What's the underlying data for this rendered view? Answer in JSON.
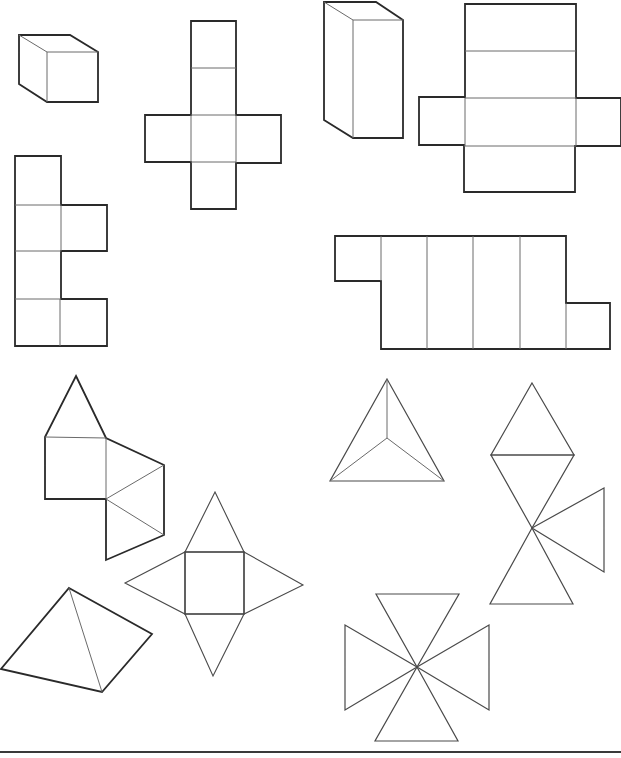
{
  "page": {
    "title": "Solids and their nets worksheet",
    "line_color": "#2a2a2a",
    "inner_line_color": "#6a6a6a",
    "background": "#ffffff"
  },
  "figures": [
    {
      "id": "cube-solid",
      "label": "Cube (3D drawing)"
    },
    {
      "id": "cube-net-cross",
      "label": "Cube net (cross shape)"
    },
    {
      "id": "cuboid-solid",
      "label": "Rectangular prism (3D drawing)"
    },
    {
      "id": "cuboid-net",
      "label": "Rectangular prism net"
    },
    {
      "id": "cube-net-zigzag",
      "label": "Cube net (vertical strip with side flaps)"
    },
    {
      "id": "strip-net",
      "label": "Net with four rectangles and two end squares"
    },
    {
      "id": "house-net",
      "label": "Net: square with triangles"
    },
    {
      "id": "tetrahedron-solid",
      "label": "Triangular pyramid (top view)"
    },
    {
      "id": "bowtie-net",
      "label": "Net of triangles meeting at a point"
    },
    {
      "id": "square-pyramid-net",
      "label": "Square pyramid net"
    },
    {
      "id": "pyramid-solid",
      "label": "Pyramid (3D drawing)"
    },
    {
      "id": "pinwheel-net",
      "label": "Four triangles meeting at a point"
    }
  ]
}
